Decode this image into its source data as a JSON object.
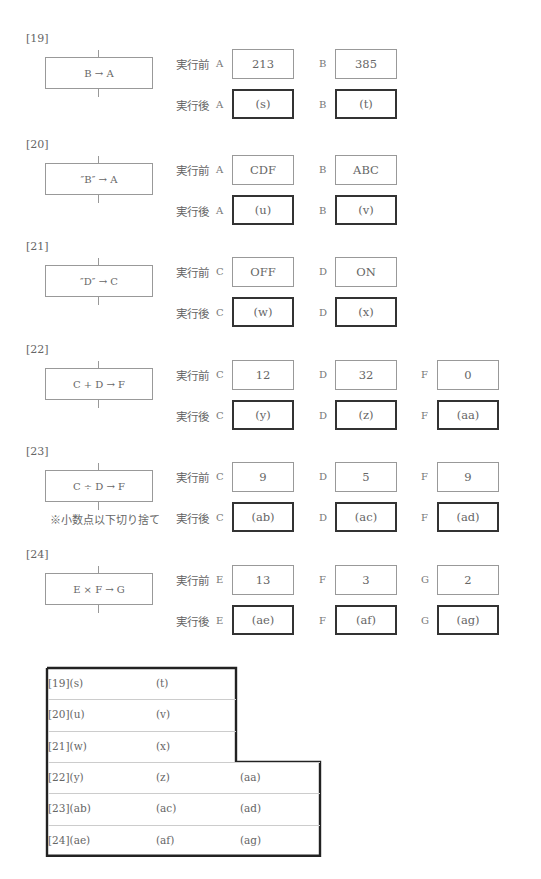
{
  "labels": {
    "before": "実行前",
    "after": "実行後"
  },
  "questions": [
    {
      "id": "[19]",
      "process": "B → A",
      "vars": [
        {
          "name": "A",
          "before": "213",
          "after": "(s)"
        },
        {
          "name": "B",
          "before": "385",
          "after": "(t)"
        }
      ]
    },
    {
      "id": "[20]",
      "process": "″B″ → A",
      "vars": [
        {
          "name": "A",
          "before": "CDF",
          "after": "(u)"
        },
        {
          "name": "B",
          "before": "ABC",
          "after": "(v)"
        }
      ]
    },
    {
      "id": "[21]",
      "process": "″D″ → C",
      "vars": [
        {
          "name": "C",
          "before": "OFF",
          "after": "(w)"
        },
        {
          "name": "D",
          "before": "ON",
          "after": "(x)"
        }
      ]
    },
    {
      "id": "[22]",
      "process": "C + D → F",
      "vars": [
        {
          "name": "C",
          "before": "12",
          "after": "(y)"
        },
        {
          "name": "D",
          "before": "32",
          "after": "(z)"
        },
        {
          "name": "F",
          "before": "0",
          "after": "(aa)"
        }
      ]
    },
    {
      "id": "[23]",
      "process": "C ÷ D → F",
      "note": "※小数点以下切り捨て",
      "vars": [
        {
          "name": "C",
          "before": "9",
          "after": "(ab)"
        },
        {
          "name": "D",
          "before": "5",
          "after": "(ac)"
        },
        {
          "name": "F",
          "before": "9",
          "after": "(ad)"
        }
      ]
    },
    {
      "id": "[24]",
      "process": "E × F → G",
      "vars": [
        {
          "name": "E",
          "before": "13",
          "after": "(ae)"
        },
        {
          "name": "F",
          "before": "3",
          "after": "(af)"
        },
        {
          "name": "G",
          "before": "2",
          "after": "(ag)"
        }
      ]
    }
  ],
  "answer_table": {
    "rows": [
      [
        "[19](s)",
        "(t)",
        ""
      ],
      [
        "[20](u)",
        "(v)",
        ""
      ],
      [
        "[21](w)",
        "(x)",
        ""
      ],
      [
        "[22](y)",
        "(z)",
        "(aa)"
      ],
      [
        "[23](ab)",
        "(ac)",
        "(ad)"
      ],
      [
        "[24](ae)",
        "(af)",
        "(ag)"
      ]
    ]
  }
}
